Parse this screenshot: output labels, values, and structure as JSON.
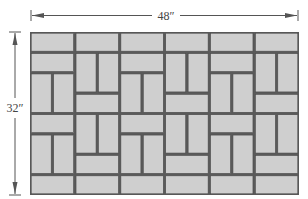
{
  "diagram": {
    "width_label": "48″",
    "height_label": "32″",
    "width_inches": 48,
    "height_inches": 32,
    "brick_size_inches": [
      8,
      4
    ],
    "colors": {
      "brick_fill": "#cfcfcf",
      "brick_stroke": "#4a4a4a",
      "mortar": "#5a5a5a",
      "dimension_line": "#555555"
    },
    "grid": {
      "columns": 6,
      "rows": 8,
      "origin_px": [
        30,
        32
      ],
      "size_px": [
        269,
        163
      ]
    },
    "column_pattern": [
      [
        "H",
        "H",
        "V",
        "V",
        "H",
        "V",
        "V",
        "H"
      ],
      [
        "H",
        "V",
        "V",
        "H",
        "V",
        "V",
        "H",
        "H"
      ],
      [
        "H",
        "H",
        "V",
        "V",
        "H",
        "V",
        "V",
        "H"
      ],
      [
        "H",
        "V",
        "V",
        "H",
        "V",
        "V",
        "H",
        "H"
      ],
      [
        "H",
        "H",
        "V",
        "V",
        "H",
        "V",
        "V",
        "H"
      ],
      [
        "H",
        "V",
        "V",
        "H",
        "V",
        "V",
        "H",
        "H"
      ]
    ]
  }
}
